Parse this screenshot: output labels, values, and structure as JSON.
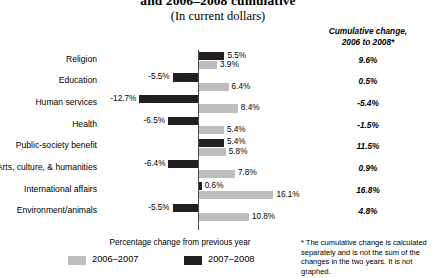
{
  "header": {
    "title_line": "and 2006–2008 cumulative",
    "subtitle": "(In current dollars)",
    "cumulative_header": "Cumulative change,\n2006 to 2008*"
  },
  "legend": {
    "axis_caption": "Percentage change from previous year",
    "items": [
      {
        "label": "2006–2007",
        "color": "#bdbdbd"
      },
      {
        "label": "2007–2008",
        "color": "#231f20"
      }
    ]
  },
  "footnote": "* The cumulative change is calculated separately and is not the sum of the changes in the two years. It is not graphed.",
  "chart_data": {
    "type": "bar",
    "title": "and 2006–2008 cumulative",
    "subtitle": "(In current dollars)",
    "xlabel": "Percentage change from previous year",
    "ylabel": "",
    "orientation": "horizontal",
    "grid": false,
    "legend_position": "bottom",
    "xlim": [
      -14,
      18
    ],
    "categories": [
      "Religion",
      "Education",
      "Human services",
      "Health",
      "Public-society benefit",
      "Arts, culture, & humanities",
      "International affairs",
      "Environment/animals"
    ],
    "series": [
      {
        "name": "2007–2008",
        "color": "#231f20",
        "values": [
          5.5,
          -5.5,
          -12.7,
          -6.5,
          5.4,
          -6.4,
          0.6,
          -5.5
        ],
        "labels": [
          "5.5%",
          "-5.5%",
          "-12.7%",
          "-6.5%",
          "5.4%",
          "-6.4%",
          "0.6%",
          "-5.5%"
        ]
      },
      {
        "name": "2006–2007",
        "color": "#bdbdbd",
        "values": [
          3.9,
          6.4,
          8.4,
          5.4,
          5.8,
          7.8,
          16.1,
          10.8
        ],
        "labels": [
          "3.9%",
          "6.4%",
          "8.4%",
          "5.4%",
          "5.8%",
          "7.8%",
          "16.1%",
          "10.8%"
        ]
      }
    ],
    "cumulative_change_2006_to_2008": {
      "header": "Cumulative change, 2006 to 2008*",
      "values": [
        9.6,
        0.5,
        -5.4,
        -1.5,
        11.5,
        0.9,
        16.8,
        4.8
      ],
      "labels": [
        "9.6%",
        "0.5%",
        "-5.4%",
        "-1.5%",
        "11.5%",
        "0.9%",
        "16.8%",
        "4.8%"
      ]
    }
  }
}
